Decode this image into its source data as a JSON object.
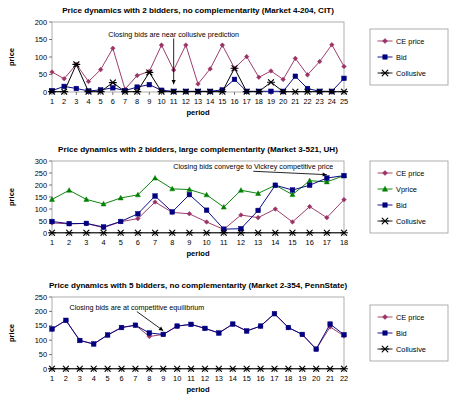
{
  "chart_data": [
    {
      "id": "market-4-204-cit",
      "type": "line",
      "title": "Price dynamics with 2 bidders, no complementarity (Market 4-204, CIT)",
      "xlabel": "period",
      "ylabel": "price",
      "xlim": [
        1,
        25
      ],
      "ylim": [
        0,
        200
      ],
      "yticks": [
        0,
        50,
        100,
        150,
        200
      ],
      "grid": false,
      "legend_position": "right",
      "annotations": [
        {
          "text": "Closing bids are near collusive prediction",
          "arrow_from_x": 11.0,
          "arrow_from_y": 150,
          "arrow_to_x": 11.0,
          "arrow_to_y": 22
        }
      ],
      "categories": [
        1,
        2,
        3,
        4,
        5,
        6,
        7,
        8,
        9,
        10,
        11,
        12,
        13,
        14,
        15,
        16,
        17,
        18,
        19,
        20,
        21,
        22,
        23,
        24,
        25
      ],
      "series": [
        {
          "name": "CE price",
          "color": "#993366",
          "marker": "diamond",
          "values": [
            57,
            38,
            79,
            30,
            64,
            125,
            8,
            47,
            59,
            134,
            63,
            134,
            23,
            66,
            134,
            68,
            101,
            42,
            60,
            36,
            96,
            49,
            87,
            135,
            73
          ]
        },
        {
          "name": "Bid",
          "color": "#000080",
          "marker": "square",
          "values": [
            4,
            16,
            10,
            3,
            6,
            12,
            4,
            14,
            21,
            5,
            2,
            2,
            2,
            2,
            6,
            36,
            2,
            2,
            2,
            2,
            45,
            10,
            2,
            2,
            39
          ]
        },
        {
          "name": "Collusive",
          "color": "#000000",
          "marker": "cross",
          "values": [
            1,
            1,
            79,
            1,
            1,
            27,
            1,
            1,
            56,
            1,
            1,
            1,
            1,
            1,
            1,
            68,
            1,
            1,
            28,
            1,
            1,
            1,
            1,
            1,
            1
          ]
        }
      ]
    },
    {
      "id": "market-3-521-uh",
      "type": "line",
      "title": "Price dynamics with 2 bidders, large complementarity (Market 3-521, UH)",
      "xlabel": "period",
      "ylabel": "price",
      "xlim": [
        1,
        18
      ],
      "ylim": [
        0,
        300
      ],
      "yticks": [
        0,
        50,
        100,
        150,
        200,
        250,
        300
      ],
      "grid": false,
      "legend_position": "right",
      "annotations": [
        {
          "text": "Closing bids converge to Vickrey competitive price",
          "arrow_from_x": 14.4,
          "arrow_from_y": 253,
          "arrow_to_x": 17.0,
          "arrow_to_y": 243
        }
      ],
      "categories": [
        1,
        2,
        3,
        4,
        5,
        6,
        7,
        8,
        9,
        10,
        11,
        12,
        13,
        14,
        15,
        16,
        17,
        18
      ],
      "series": [
        {
          "name": "CE price",
          "color": "#993366",
          "marker": "diamond",
          "values": [
            42,
            38,
            40,
            22,
            47,
            60,
            129,
            86,
            80,
            46,
            15,
            75,
            64,
            100,
            46,
            110,
            64,
            139
          ]
        },
        {
          "name": "Vprice",
          "color": "#008000",
          "marker": "triangle",
          "values": [
            140,
            178,
            140,
            121,
            146,
            159,
            229,
            184,
            181,
            159,
            108,
            178,
            165,
            199,
            160,
            218,
            213,
            239
          ]
        },
        {
          "name": "Bid",
          "color": "#000080",
          "marker": "square",
          "values": [
            48,
            39,
            40,
            25,
            48,
            80,
            154,
            88,
            160,
            95,
            16,
            18,
            94,
            199,
            179,
            199,
            229,
            239
          ]
        },
        {
          "name": "Collusive",
          "color": "#000000",
          "marker": "cross",
          "values": [
            1,
            1,
            1,
            1,
            1,
            1,
            1,
            1,
            1,
            1,
            1,
            1,
            1,
            1,
            1,
            1,
            1,
            1
          ]
        }
      ]
    },
    {
      "id": "market-2-354-pennstate",
      "type": "line",
      "title": "Price dynamics with 5 bidders, no complementarity (Market 2-354, PennState)",
      "xlabel": "period",
      "ylabel": "price",
      "xlim": [
        1,
        22
      ],
      "ylim": [
        0,
        250
      ],
      "yticks": [
        0,
        50,
        100,
        150,
        200,
        250
      ],
      "grid": false,
      "legend_position": "right",
      "annotations": [
        {
          "text": "Closing bids are at competitive equilibrium",
          "arrow_from_x": 7.1,
          "arrow_from_y": 196,
          "arrow_to_x": 9.0,
          "arrow_to_y": 133
        }
      ],
      "categories": [
        1,
        2,
        3,
        4,
        5,
        6,
        7,
        8,
        9,
        10,
        11,
        12,
        13,
        14,
        15,
        16,
        17,
        18,
        19,
        20,
        21,
        22
      ],
      "series": [
        {
          "name": "CE price",
          "color": "#993366",
          "marker": "diamond",
          "values": [
            139,
            169,
            99,
            87,
            118,
            144,
            152,
            113,
            120,
            149,
            155,
            141,
            125,
            156,
            132,
            149,
            192,
            144,
            120,
            69,
            146,
            115
          ]
        },
        {
          "name": "Bid",
          "color": "#000080",
          "marker": "square",
          "values": [
            139,
            169,
            99,
            87,
            118,
            144,
            152,
            125,
            120,
            149,
            155,
            141,
            125,
            156,
            132,
            149,
            192,
            144,
            120,
            69,
            156,
            119
          ]
        },
        {
          "name": "Collusive",
          "color": "#000000",
          "marker": "cross",
          "values": [
            1,
            1,
            1,
            1,
            1,
            1,
            1,
            1,
            1,
            1,
            1,
            1,
            1,
            1,
            1,
            1,
            1,
            1,
            1,
            1,
            1,
            1
          ]
        }
      ]
    }
  ]
}
